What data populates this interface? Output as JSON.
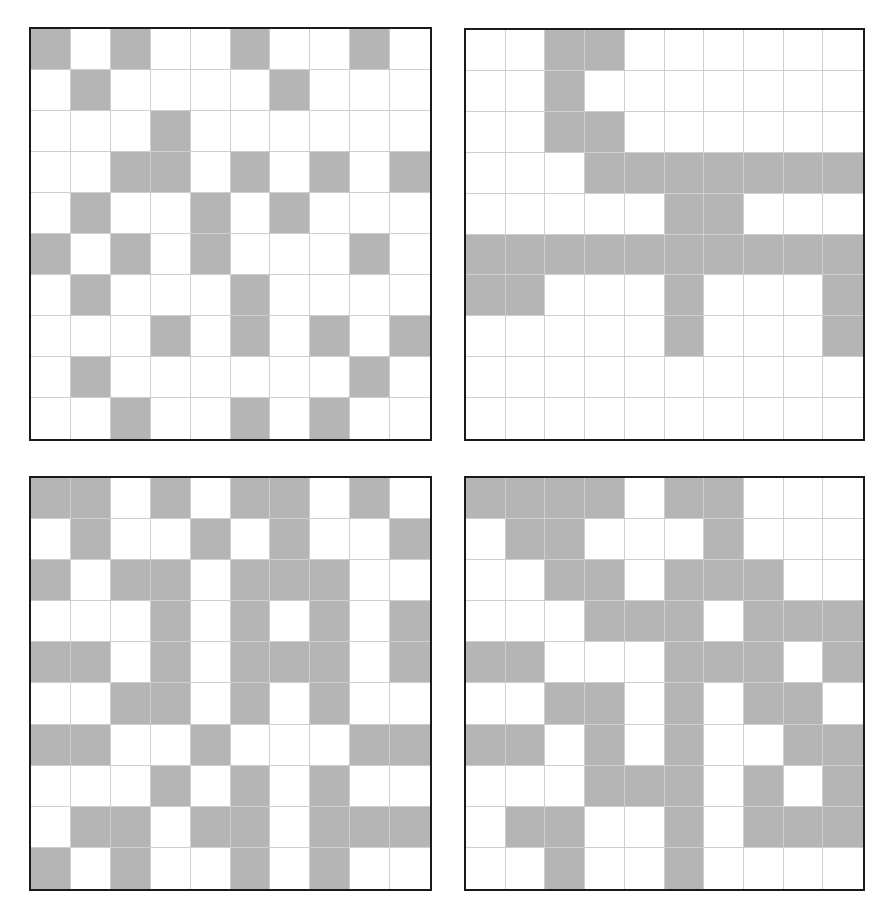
{
  "colors": {
    "filled": "#b5b5b5",
    "empty": "#ffffff",
    "gridline": "#cfcfcf",
    "border": "#1a1a1a"
  },
  "grids": [
    {
      "id": "grid-1",
      "position": "top-left",
      "rows": 10,
      "cols": 10,
      "cells": [
        [
          1,
          0,
          1,
          0,
          0,
          1,
          0,
          0,
          1,
          0
        ],
        [
          0,
          1,
          0,
          0,
          0,
          0,
          1,
          0,
          0,
          0
        ],
        [
          0,
          0,
          0,
          1,
          0,
          0,
          0,
          0,
          0,
          0
        ],
        [
          0,
          0,
          1,
          1,
          0,
          1,
          0,
          1,
          0,
          1
        ],
        [
          0,
          1,
          0,
          0,
          1,
          0,
          1,
          0,
          0,
          0
        ],
        [
          1,
          0,
          1,
          0,
          1,
          0,
          0,
          0,
          1,
          0
        ],
        [
          0,
          1,
          0,
          0,
          0,
          1,
          0,
          0,
          0,
          0
        ],
        [
          0,
          0,
          0,
          1,
          0,
          1,
          0,
          1,
          0,
          1
        ],
        [
          0,
          1,
          0,
          0,
          0,
          0,
          0,
          0,
          1,
          0
        ],
        [
          0,
          0,
          1,
          0,
          0,
          1,
          0,
          1,
          0,
          0
        ]
      ]
    },
    {
      "id": "grid-2",
      "position": "top-right",
      "rows": 10,
      "cols": 10,
      "cells": [
        [
          0,
          0,
          1,
          1,
          0,
          0,
          0,
          0,
          0,
          0
        ],
        [
          0,
          0,
          1,
          0,
          0,
          0,
          0,
          0,
          0,
          0
        ],
        [
          0,
          0,
          1,
          1,
          0,
          0,
          0,
          0,
          0,
          0
        ],
        [
          0,
          0,
          0,
          1,
          1,
          1,
          1,
          1,
          1,
          1
        ],
        [
          0,
          0,
          0,
          0,
          0,
          1,
          1,
          0,
          0,
          0
        ],
        [
          1,
          1,
          1,
          1,
          1,
          1,
          1,
          1,
          1,
          1
        ],
        [
          1,
          1,
          0,
          0,
          0,
          1,
          0,
          0,
          0,
          1
        ],
        [
          0,
          0,
          0,
          0,
          0,
          1,
          0,
          0,
          0,
          1
        ],
        [
          0,
          0,
          0,
          0,
          0,
          0,
          0,
          0,
          0,
          0
        ],
        [
          0,
          0,
          0,
          0,
          0,
          0,
          0,
          0,
          0,
          0
        ]
      ]
    },
    {
      "id": "grid-3",
      "position": "bottom-left",
      "rows": 10,
      "cols": 10,
      "cells": [
        [
          1,
          1,
          0,
          1,
          0,
          1,
          1,
          0,
          1,
          0
        ],
        [
          0,
          1,
          0,
          0,
          1,
          0,
          1,
          0,
          0,
          1
        ],
        [
          1,
          0,
          1,
          1,
          0,
          1,
          1,
          1,
          0,
          0
        ],
        [
          0,
          0,
          0,
          1,
          0,
          1,
          0,
          1,
          0,
          1
        ],
        [
          1,
          1,
          0,
          1,
          0,
          1,
          1,
          1,
          0,
          1
        ],
        [
          0,
          0,
          1,
          1,
          0,
          1,
          0,
          1,
          0,
          0
        ],
        [
          1,
          1,
          0,
          0,
          1,
          0,
          0,
          0,
          1,
          1
        ],
        [
          0,
          0,
          0,
          1,
          0,
          1,
          0,
          1,
          0,
          0
        ],
        [
          0,
          1,
          1,
          0,
          1,
          1,
          0,
          1,
          1,
          1
        ],
        [
          1,
          0,
          1,
          0,
          0,
          1,
          0,
          1,
          0,
          0
        ]
      ]
    },
    {
      "id": "grid-4",
      "position": "bottom-right",
      "rows": 10,
      "cols": 10,
      "cells": [
        [
          1,
          1,
          1,
          1,
          0,
          1,
          1,
          0,
          0,
          0
        ],
        [
          0,
          1,
          1,
          0,
          0,
          0,
          1,
          0,
          0,
          0
        ],
        [
          0,
          0,
          1,
          1,
          0,
          1,
          1,
          1,
          0,
          0
        ],
        [
          0,
          0,
          0,
          1,
          1,
          1,
          0,
          1,
          1,
          1
        ],
        [
          1,
          1,
          0,
          0,
          0,
          1,
          1,
          1,
          0,
          1
        ],
        [
          0,
          0,
          1,
          1,
          0,
          1,
          0,
          1,
          1,
          0
        ],
        [
          1,
          1,
          0,
          1,
          0,
          1,
          0,
          0,
          1,
          1
        ],
        [
          0,
          0,
          0,
          1,
          1,
          1,
          0,
          1,
          0,
          1
        ],
        [
          0,
          1,
          1,
          0,
          0,
          1,
          0,
          1,
          1,
          1
        ],
        [
          0,
          0,
          1,
          0,
          0,
          1,
          0,
          0,
          0,
          0
        ]
      ]
    }
  ]
}
